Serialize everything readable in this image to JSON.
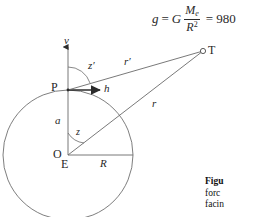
{
  "equation": {
    "lhs": "g",
    "equals_1": "=",
    "const": "G",
    "numerator": "M",
    "numerator_sub": "e",
    "denominator": "R",
    "denominator_sup": "2",
    "equals_2": "=",
    "value": "980"
  },
  "diagram": {
    "labels": {
      "v_axis": "v",
      "z_prime": "z",
      "z_prime_mark": "′",
      "point_p": "P",
      "h_vector": "h",
      "a_segment": "a",
      "z_angle": "z",
      "point_o": "O",
      "point_e": "E",
      "radius": "R",
      "r_prime": "r",
      "r_prime_mark": "′",
      "r_line": "r",
      "point_t": "T"
    },
    "colors": {
      "stroke": "#5a5a5a",
      "circle": "#6b6b6b",
      "text": "#1f1f1f"
    }
  },
  "caption": {
    "line1": "Figu",
    "line2": "forc",
    "line3": "facin"
  }
}
